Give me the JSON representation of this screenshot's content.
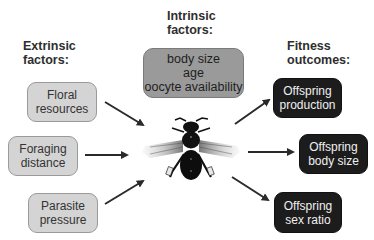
{
  "headings": {
    "extrinsic": [
      "Extrinsic",
      "factors:"
    ],
    "intrinsic": [
      "Intrinsic",
      "factors:"
    ],
    "fitness": [
      "Fitness",
      "outcomes:"
    ]
  },
  "extrinsic_factors": [
    {
      "lines": [
        "Floral",
        "resources"
      ]
    },
    {
      "lines": [
        "Foraging",
        "distance"
      ]
    },
    {
      "lines": [
        "Parasite",
        "pressure"
      ]
    }
  ],
  "intrinsic_factors": {
    "lines": [
      "body size",
      "age",
      "oocyte availability"
    ]
  },
  "fitness_outcomes": [
    {
      "lines": [
        "Offspring",
        "production"
      ]
    },
    {
      "lines": [
        "Offspring",
        "body size"
      ]
    },
    {
      "lines": [
        "Offspring",
        "sex ratio"
      ]
    }
  ],
  "center_image": {
    "icon": "bee-icon"
  },
  "colors": {
    "extrinsic_fill": "#d4d4d4",
    "intrinsic_fill": "#9a9a9a",
    "outcome_fill": "#1c1c1c",
    "arrow": "#2a2a2a"
  }
}
